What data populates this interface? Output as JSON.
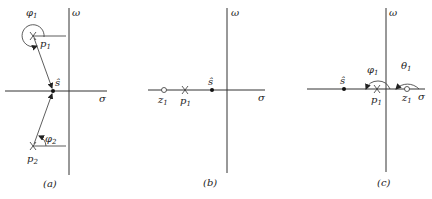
{
  "panels": [
    {
      "id": "a",
      "caption": "(a)",
      "axis_labels": {
        "vertical": "ω",
        "horizontal": "σ"
      },
      "points": [
        {
          "name": "p1",
          "kind": "pole",
          "label": "p",
          "subscript": "1"
        },
        {
          "name": "p2",
          "kind": "pole",
          "label": "p",
          "subscript": "2"
        },
        {
          "name": "s_hat",
          "kind": "test-point",
          "label": "ŝ"
        }
      ],
      "angles": [
        {
          "label": "φ",
          "subscript": "1",
          "at": "p1"
        },
        {
          "label": "φ",
          "subscript": "2",
          "at": "p2"
        }
      ]
    },
    {
      "id": "b",
      "caption": "(b)",
      "axis_labels": {
        "vertical": "ω",
        "horizontal": "σ"
      },
      "points": [
        {
          "name": "z1",
          "kind": "zero",
          "label": "z",
          "subscript": "1"
        },
        {
          "name": "p1",
          "kind": "pole",
          "label": "p",
          "subscript": "1"
        },
        {
          "name": "s_hat",
          "kind": "test-point",
          "label": "ŝ"
        }
      ]
    },
    {
      "id": "c",
      "caption": "(c)",
      "axis_labels": {
        "vertical": "ω",
        "horizontal": "σ"
      },
      "points": [
        {
          "name": "s_hat",
          "kind": "test-point",
          "label": "ŝ"
        },
        {
          "name": "p1",
          "kind": "pole",
          "label": "p",
          "subscript": "1"
        },
        {
          "name": "z1",
          "kind": "zero",
          "label": "z",
          "subscript": "1"
        }
      ],
      "angles": [
        {
          "label": "φ",
          "subscript": "1",
          "at": "p1"
        },
        {
          "label": "θ",
          "subscript": "1",
          "at": "z1"
        }
      ]
    }
  ]
}
